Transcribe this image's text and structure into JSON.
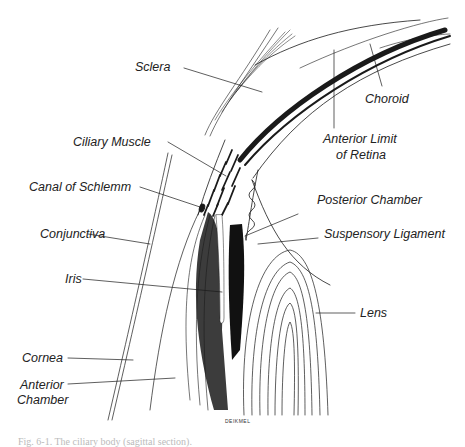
{
  "figure": {
    "caption": "Fig. 6-1. The ciliary body (sagittal section).",
    "artist_signature": "DEIKMEL"
  },
  "labels": {
    "sclera": "Sclera",
    "choroid": "Choroid",
    "ciliary_muscle": "Ciliary Muscle",
    "anterior_limit_line1": "Anterior Limit",
    "anterior_limit_line2": "of Retina",
    "canal_of_schlemm": "Canal of Schlemm",
    "posterior_chamber": "Posterior Chamber",
    "conjunctiva": "Conjunctiva",
    "suspensory_ligament": "Suspensory Ligament",
    "iris": "Iris",
    "lens": "Lens",
    "cornea": "Cornea",
    "anterior_chamber_line1": "Anterior",
    "anterior_chamber_line2": "Chamber"
  },
  "colors": {
    "ink": "#1a1a1a",
    "background": "#ffffff"
  }
}
